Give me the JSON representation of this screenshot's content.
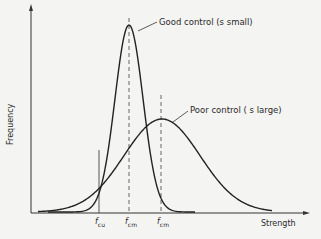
{
  "diagram": {
    "type": "normal-distribution-comparison",
    "axes": {
      "xlabel": "Strength",
      "ylabel": "Frequency"
    },
    "curves": [
      {
        "name": "good-control",
        "label": "Good control (s small)",
        "peak_x": 129,
        "peak_y": 25,
        "sigma_px": 14
      },
      {
        "name": "poor-control",
        "label": "Poor control ( s large)",
        "peak_x": 162,
        "peak_y": 119,
        "sigma_px": 38
      }
    ],
    "markers": [
      {
        "name": "f-cu",
        "base": "f",
        "sub": "cu",
        "x": 99,
        "style": "solid"
      },
      {
        "name": "f-cm-good",
        "base": "f",
        "sub": "cm",
        "x": 129,
        "style": "dashed"
      },
      {
        "name": "f-cm-poor",
        "base": "f",
        "sub": "cm",
        "x": 161,
        "style": "dashed"
      }
    ],
    "colors": {
      "line": "#222222",
      "background": "#f4f4f2"
    }
  }
}
